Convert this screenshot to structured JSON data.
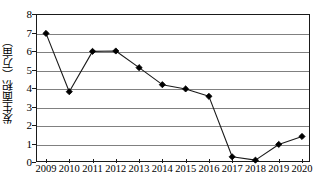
{
  "chart_data": {
    "type": "line",
    "title": "",
    "xlabel": "",
    "ylabel": "发生面积（万亩）",
    "categories": [
      "2009",
      "2010",
      "2011",
      "2012",
      "2013",
      "2014",
      "2015",
      "2016",
      "2017",
      "2018",
      "2019",
      "2020"
    ],
    "values": [
      6.95,
      3.8,
      5.98,
      6.0,
      5.1,
      4.18,
      3.95,
      3.55,
      0.28,
      0.1,
      0.95,
      1.38
    ],
    "series": [
      {
        "name": "发生面积（万亩）",
        "values": [
          6.95,
          3.8,
          5.98,
          6.0,
          5.1,
          4.18,
          3.95,
          3.55,
          0.28,
          0.1,
          0.95,
          1.38
        ]
      }
    ],
    "ylim": [
      0,
      8
    ],
    "yticks": [
      "0",
      "1",
      "2",
      "3",
      "4",
      "5",
      "6",
      "7",
      "8"
    ],
    "ytick_values": [
      0,
      1,
      2,
      3,
      4,
      5,
      6,
      7,
      8
    ],
    "grid": true,
    "grid_axis": "y",
    "legend": "none",
    "marker": "diamond",
    "line_color": "#1a1a1a",
    "marker_color": "#000000",
    "grid_color": "#808080",
    "frame_color": "#1a1a1a",
    "background_color": "#ffffff"
  }
}
